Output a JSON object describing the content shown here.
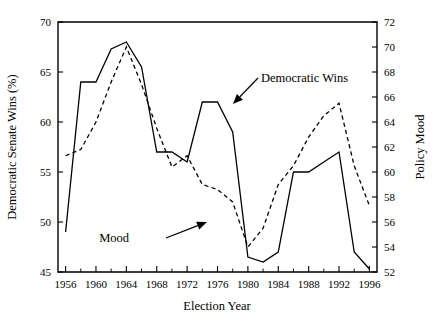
{
  "chart_data": {
    "type": "line",
    "title": "",
    "xlabel": "Election Year",
    "ylabel": "Democratic Senate Wins (%)",
    "y2label": "Policy Mood",
    "grid": false,
    "legend_position": "inline-annotations",
    "xlim": [
      1955,
      1997
    ],
    "ylim": [
      45,
      70
    ],
    "y2lim": [
      52,
      72
    ],
    "x": [
      1956,
      1958,
      1960,
      1962,
      1964,
      1966,
      1968,
      1970,
      1972,
      1974,
      1976,
      1978,
      1980,
      1982,
      1984,
      1986,
      1988,
      1990,
      1992,
      1994,
      1996
    ],
    "xticks": [
      1956,
      1960,
      1964,
      1968,
      1972,
      1976,
      1980,
      1984,
      1988,
      1992,
      1996
    ],
    "xticklabels": [
      "1956",
      "1960",
      "1964",
      "1968",
      "1972",
      "1976",
      "1980",
      "1984",
      "1988",
      "1992",
      "1996"
    ],
    "xminorticks": [
      1958,
      1962,
      1966,
      1970,
      1974,
      1978,
      1982,
      1986,
      1990,
      1994
    ],
    "yticks": [
      45,
      50,
      55,
      60,
      65,
      70
    ],
    "yticklabels": [
      "45",
      "50",
      "55",
      "60",
      "65",
      "70"
    ],
    "y2ticks": [
      52,
      54,
      56,
      58,
      60,
      62,
      64,
      66,
      68,
      70,
      72
    ],
    "y2ticklabels": [
      "52",
      "54",
      "56",
      "58",
      "60",
      "62",
      "64",
      "66",
      "68",
      "70",
      "72"
    ],
    "series": [
      {
        "name": "Democratic Wins",
        "axis": "left",
        "style": "solid",
        "color": "#000000",
        "values": [
          49.0,
          64.0,
          64.0,
          67.3,
          68.0,
          65.5,
          57.0,
          57.0,
          56.0,
          62.0,
          62.0,
          59.0,
          46.5,
          46.0,
          47.0,
          55.0,
          55.0,
          56.0,
          57.0,
          47.0,
          45.3
        ]
      },
      {
        "name": "Mood",
        "axis": "right",
        "style": "dashed",
        "color": "#000000",
        "values": [
          61.3,
          61.8,
          64.0,
          67.2,
          70.0,
          67.0,
          63.5,
          60.4,
          61.3,
          59.0,
          58.6,
          57.6,
          54.0,
          55.5,
          59.0,
          60.5,
          62.8,
          64.5,
          65.5,
          60.5,
          57.3
        ]
      }
    ],
    "annotations": [
      {
        "text": "Democratic Wins",
        "label_x": 261,
        "label_y": 82,
        "arrow_x1": 258,
        "arrow_y1": 78,
        "arrow_x2": 233,
        "arrow_y2": 104
      },
      {
        "text": "Mood",
        "label_x": 129,
        "label_y": 242,
        "arrow_x1": 166,
        "arrow_y1": 238,
        "arrow_x2": 207,
        "arrow_y2": 222
      }
    ]
  }
}
